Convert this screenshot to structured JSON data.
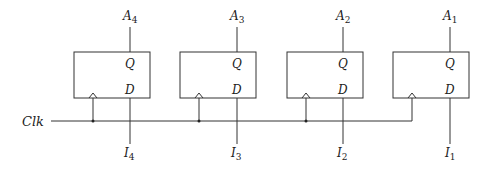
{
  "diagram": {
    "type": "register-of-d-flip-flops",
    "clock_label": "Clk",
    "pin_labels": {
      "q": "Q",
      "d": "D"
    },
    "flip_flops": [
      {
        "output_base": "A",
        "output_sub": "4",
        "input_base": "I",
        "input_sub": "4",
        "box_x": 74,
        "pin_x": 130,
        "clk_x": 93
      },
      {
        "output_base": "A",
        "output_sub": "3",
        "input_base": "I",
        "input_sub": "3",
        "box_x": 180,
        "pin_x": 237,
        "clk_x": 199
      },
      {
        "output_base": "A",
        "output_sub": "2",
        "input_base": "I",
        "input_sub": "2",
        "box_x": 287,
        "pin_x": 343,
        "clk_x": 306
      },
      {
        "output_base": "A",
        "output_sub": "1",
        "input_base": "I",
        "input_sub": "1",
        "box_x": 393,
        "pin_x": 450,
        "clk_x": 412
      }
    ]
  }
}
